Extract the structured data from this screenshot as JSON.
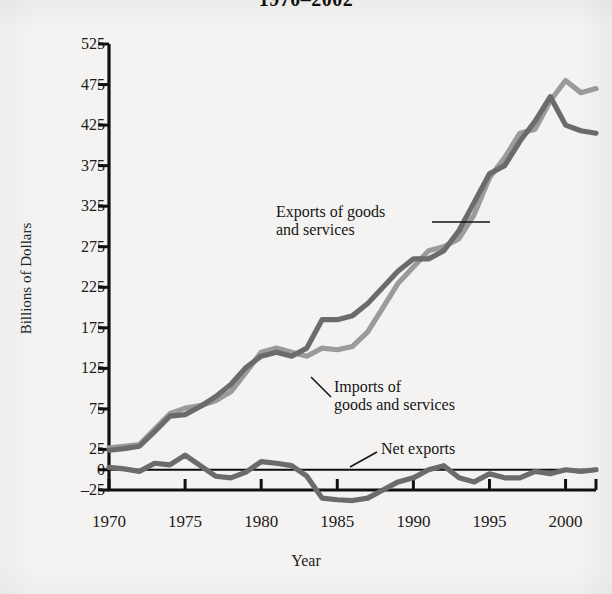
{
  "chart_data": {
    "type": "line",
    "title": "1970–2002",
    "xlabel": "Year",
    "ylabel": "Billions of Dollars",
    "xlim": [
      1970,
      2002
    ],
    "ylim": [
      -25,
      525
    ],
    "grid": false,
    "legend_position": "inline-annotations",
    "yticks": [
      -25,
      0,
      25,
      75,
      125,
      175,
      225,
      275,
      325,
      375,
      425,
      475,
      525
    ],
    "ytick_labels": [
      "-25",
      "0",
      "25",
      "75",
      "125",
      "175",
      "225",
      "275",
      "325",
      "375",
      "425",
      "475",
      "525"
    ],
    "xticks": [
      1970,
      1975,
      1980,
      1985,
      1990,
      1995,
      2000
    ],
    "xtick_labels": [
      "1970",
      "1975",
      "1980",
      "1985",
      "1990",
      "1995",
      "2000"
    ],
    "x": [
      1970,
      1971,
      1972,
      1973,
      1974,
      1975,
      1976,
      1977,
      1978,
      1979,
      1980,
      1981,
      1982,
      1983,
      1984,
      1985,
      1986,
      1987,
      1988,
      1989,
      1990,
      1991,
      1992,
      1993,
      1994,
      1995,
      1996,
      1997,
      1998,
      1999,
      2000,
      2001,
      2002
    ],
    "series": [
      {
        "name": "Exports of goods and services",
        "color": "#9b9b9b",
        "values": [
          27,
          29,
          31,
          50,
          69,
          76,
          79,
          85,
          96,
          120,
          145,
          150,
          145,
          140,
          150,
          148,
          152,
          170,
          200,
          230,
          250,
          270,
          275,
          285,
          315,
          360,
          385,
          415,
          420,
          455,
          480,
          465,
          470
        ]
      },
      {
        "name": "Imports of goods and services",
        "color": "#6b6b6b",
        "values": [
          24,
          26,
          29,
          47,
          66,
          68,
          78,
          90,
          105,
          126,
          140,
          145,
          140,
          150,
          185,
          185,
          190,
          205,
          225,
          245,
          260,
          260,
          270,
          295,
          330,
          365,
          375,
          405,
          430,
          460,
          425,
          418,
          415
        ]
      },
      {
        "name": "Net exports",
        "color": "#6b6b6b",
        "values": [
          3,
          1,
          -2,
          8,
          6,
          18,
          5,
          -8,
          -10,
          -3,
          10,
          8,
          5,
          -8,
          -35,
          -37,
          -38,
          -35,
          -25,
          -15,
          -10,
          0,
          5,
          -10,
          -15,
          -5,
          -10,
          -10,
          -2,
          -5,
          0,
          -2,
          0
        ]
      }
    ],
    "annotations": [
      {
        "name": "exports-label",
        "text": "Exports of goods\nand services"
      },
      {
        "name": "imports-label",
        "text": "Imports of\ngoods and services"
      },
      {
        "name": "net-exports-label",
        "text": "Net exports"
      }
    ]
  }
}
